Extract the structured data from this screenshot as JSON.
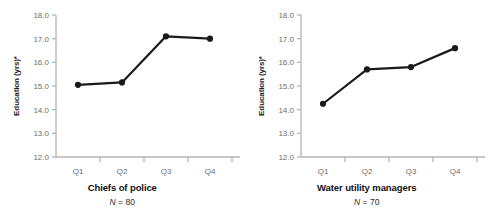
{
  "chart_data": [
    {
      "type": "line",
      "title": "Chiefs of police",
      "subtitle": "N = 80",
      "n_label_prefix": "N",
      "n_label_value": "= 80",
      "xlabel": "",
      "ylabel": "Education (yrs)*",
      "categories": [
        "Q1",
        "Q2",
        "Q3",
        "Q4"
      ],
      "values": [
        15.05,
        15.15,
        17.1,
        17.0
      ],
      "ylim": [
        12.0,
        18.0
      ],
      "yticks": [
        "18.0",
        "17.0",
        "16.0",
        "15.0",
        "14.0",
        "13.0",
        "12.0"
      ],
      "ytick_values": [
        18.0,
        17.0,
        16.0,
        15.0,
        14.0,
        13.0,
        12.0
      ],
      "grid": false,
      "legend": "none",
      "marker": "filled-circle",
      "line_color": "#1a1a1a",
      "axis_color": "#b4b4b4",
      "tick_label_color": "#6d6d6d"
    },
    {
      "type": "line",
      "title": "Water utility managers",
      "subtitle": "N = 70",
      "n_label_prefix": "N",
      "n_label_value": "= 70",
      "xlabel": "",
      "ylabel": "Education (yrs)*",
      "categories": [
        "Q1",
        "Q2",
        "Q3",
        "Q4"
      ],
      "values": [
        14.25,
        15.7,
        15.8,
        16.6
      ],
      "ylim": [
        12.0,
        18.0
      ],
      "yticks": [
        "18.0",
        "17.0",
        "16.0",
        "15.0",
        "14.0",
        "13.0",
        "12.0"
      ],
      "ytick_values": [
        18.0,
        17.0,
        16.0,
        15.0,
        14.0,
        13.0,
        12.0
      ],
      "grid": false,
      "legend": "none",
      "marker": "filled-circle",
      "line_color": "#1a1a1a",
      "axis_color": "#b4b4b4",
      "tick_label_color": "#6d6d6d"
    }
  ],
  "panels": [
    {
      "ylabel": "Education (yrs)*",
      "caption_title": "Chiefs of police",
      "caption_n_prefix": "N",
      "caption_n_rest": " = 80"
    },
    {
      "ylabel": "Education (yrs)*",
      "caption_title": "Water utility managers",
      "caption_n_prefix": "N",
      "caption_n_rest": " = 70"
    }
  ]
}
